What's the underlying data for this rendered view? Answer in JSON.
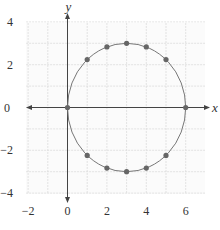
{
  "chart_data": {
    "type": "scatter",
    "title": "",
    "xlabel": "x",
    "ylabel": "y",
    "xlim": [
      -2,
      7
    ],
    "ylim": [
      -4,
      4
    ],
    "grid": true,
    "x_ticks": [
      "−2",
      "0",
      "2",
      "4",
      "6"
    ],
    "y_ticks": [
      "4",
      "2",
      "0",
      "−2",
      "−4"
    ],
    "curve": {
      "shape": "circle",
      "center": [
        3,
        0
      ],
      "radius": 3,
      "equation": "(x-3)^2 + y^2 = 9"
    },
    "series": [
      {
        "name": "points",
        "x": [
          0,
          1,
          2,
          3,
          4,
          5,
          6,
          5,
          4,
          3,
          2,
          1
        ],
        "y": [
          0,
          2.24,
          2.83,
          3,
          2.83,
          2.24,
          0,
          -2.24,
          -2.83,
          -3,
          -2.83,
          -2.24
        ]
      }
    ]
  },
  "colors": {
    "grid": "#dcdcdc",
    "axis": "#444444",
    "curve": "#777777",
    "point": "#666666"
  }
}
